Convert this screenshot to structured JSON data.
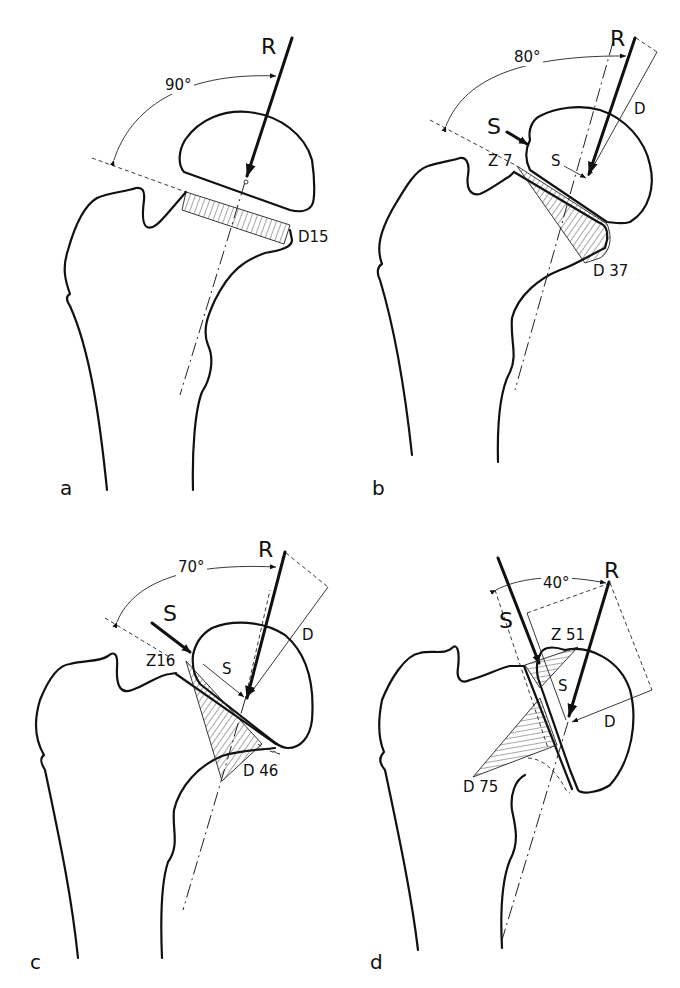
{
  "figure": {
    "panels": [
      {
        "id": "a",
        "label": "a",
        "angle": "90°",
        "force_R": "R",
        "compression": "D15"
      },
      {
        "id": "b",
        "label": "b",
        "angle": "80°",
        "force_R": "R",
        "force_S": "S",
        "lever_S": "S",
        "lever_D": "D",
        "tension": "Z 7",
        "compression": "D 37"
      },
      {
        "id": "c",
        "label": "c",
        "angle": "70°",
        "force_R": "R",
        "force_S": "S",
        "lever_S": "S",
        "lever_D": "D",
        "tension": "Z16",
        "compression": "D 46"
      },
      {
        "id": "d",
        "label": "d",
        "angle": "40°",
        "force_R": "R",
        "force_S": "S",
        "lever_S": "S",
        "lever_D": "D",
        "tension": "Z 51",
        "compression": "D 75"
      }
    ]
  }
}
